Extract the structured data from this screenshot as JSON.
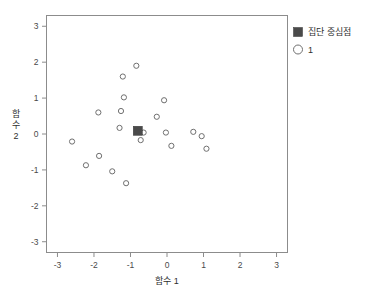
{
  "chart_data": {
    "type": "scatter",
    "title": "",
    "xlabel": "함수 1",
    "ylabel": "함수 2",
    "xlim": [
      -3.3,
      3.3
    ],
    "ylim": [
      -3.3,
      3.3
    ],
    "xticks": [
      "-3",
      "-2",
      "-1",
      "0",
      "1",
      "2",
      "3"
    ],
    "xtick_values": [
      -3,
      -2,
      -1,
      0,
      1,
      2,
      3
    ],
    "yticks": [
      "3",
      "2",
      "1",
      "0",
      "-1",
      "-2",
      "-3"
    ],
    "ytick_values": [
      3,
      2,
      1,
      0,
      -1,
      -2,
      -3
    ],
    "grid": false,
    "legend_position": "right-top",
    "series": [
      {
        "name": "1",
        "marker": "open-circle",
        "color": "#6f6f6f",
        "points": [
          {
            "x": -0.84,
            "y": 1.9
          },
          {
            "x": -1.21,
            "y": 1.6
          },
          {
            "x": -1.18,
            "y": 1.02
          },
          {
            "x": -1.88,
            "y": 0.6
          },
          {
            "x": -1.26,
            "y": 0.64
          },
          {
            "x": -0.08,
            "y": 0.94
          },
          {
            "x": -0.28,
            "y": 0.48
          },
          {
            "x": -1.3,
            "y": 0.17
          },
          {
            "x": -2.6,
            "y": -0.21
          },
          {
            "x": -0.64,
            "y": 0.04
          },
          {
            "x": -0.03,
            "y": 0.04
          },
          {
            "x": 0.72,
            "y": 0.06
          },
          {
            "x": 0.95,
            "y": -0.06
          },
          {
            "x": -0.72,
            "y": -0.17
          },
          {
            "x": 0.12,
            "y": -0.33
          },
          {
            "x": 1.08,
            "y": -0.41
          },
          {
            "x": -1.86,
            "y": -0.61
          },
          {
            "x": -2.22,
            "y": -0.87
          },
          {
            "x": -1.5,
            "y": -1.04
          },
          {
            "x": -1.12,
            "y": -1.37
          }
        ]
      },
      {
        "name": "집단 중심점",
        "marker": "filled-square",
        "color": "#4a4a4a",
        "points": [
          {
            "x": -0.8,
            "y": 0.09
          }
        ]
      }
    ],
    "legend": [
      {
        "label": "집단 중심점",
        "marker": "filled-square"
      },
      {
        "label": "1",
        "marker": "open-circle"
      }
    ]
  },
  "axes": {
    "x_label": "함수 1",
    "y_label_lines": [
      "함",
      "수",
      "2"
    ],
    "x_tick_labels": [
      "-3",
      "-2",
      "-1",
      "0",
      "1",
      "2",
      "3"
    ],
    "y_tick_labels": [
      "3",
      "2",
      "1",
      "0",
      "-1",
      "-2",
      "-3"
    ]
  },
  "legend": {
    "centroid_label": "집단 중심점",
    "cluster_label": "1"
  },
  "colors": {
    "frame": "#8c8c8c",
    "point_stroke": "#6f6f6f",
    "centroid_fill": "#4a4a4a",
    "text": "#2e2e2e",
    "background": "#ffffff"
  }
}
